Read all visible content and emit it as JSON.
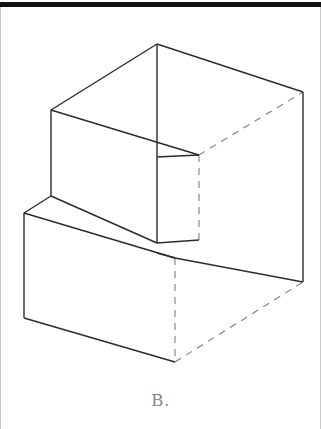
{
  "figure": {
    "caption": "B.",
    "type": "isometric-line-drawing",
    "stroke_color": "#2b2b2b",
    "hidden_stroke_color": "#7d7d7d",
    "background_color": "#ffffff",
    "rule_color": "#111111",
    "border_color": "#c9c9c9",
    "caption_color": "#8a8a8a",
    "solid_edges": [
      {
        "name": "top-left-edge",
        "x1": 157,
        "y1": 44,
        "x2": 51,
        "y2": 110
      },
      {
        "name": "top-right-edge",
        "x1": 157,
        "y1": 44,
        "x2": 303,
        "y2": 92
      },
      {
        "name": "center-vertical-front-edge",
        "x1": 157,
        "y1": 44,
        "x2": 157,
        "y2": 243
      },
      {
        "name": "upper-left-vertical-edge",
        "x1": 51,
        "y1": 110,
        "x2": 51,
        "y2": 196
      },
      {
        "name": "upper-front-face-diagonal",
        "x1": 51,
        "y1": 110,
        "x2": 199,
        "y2": 155
      },
      {
        "name": "upper-step-top-edge",
        "x1": 157,
        "y1": 157,
        "x2": 199,
        "y2": 155
      },
      {
        "name": "step-lower-left-diagonal",
        "x1": 51,
        "y1": 196,
        "x2": 157,
        "y2": 243
      },
      {
        "name": "step-top-right-edge",
        "x1": 157,
        "y1": 243,
        "x2": 199,
        "y2": 240
      },
      {
        "name": "lower-left-short-vertical",
        "x1": 24,
        "y1": 213,
        "x2": 24,
        "y2": 318
      },
      {
        "name": "lower-left-top-diagonal",
        "x1": 24,
        "y1": 213,
        "x2": 51,
        "y2": 196
      },
      {
        "name": "lower-front-top-diagonal",
        "x1": 24,
        "y1": 213,
        "x2": 175,
        "y2": 258
      },
      {
        "name": "lower-step-face-edge",
        "x1": 157,
        "y1": 253,
        "x2": 175,
        "y2": 258
      },
      {
        "name": "lower-front-bottom-diagonal",
        "x1": 24,
        "y1": 318,
        "x2": 175,
        "y2": 362
      },
      {
        "name": "lower-right-top-diagonal",
        "x1": 175,
        "y1": 258,
        "x2": 303,
        "y2": 282
      },
      {
        "name": "right-rear-vertical-solid",
        "x1": 303,
        "y1": 92,
        "x2": 303,
        "y2": 282
      }
    ],
    "dashed_edges": [
      {
        "name": "hidden-upper-rear-diagonal",
        "x1": 199,
        "y1": 155,
        "x2": 303,
        "y2": 92
      },
      {
        "name": "hidden-upper-vertical",
        "x1": 199,
        "y1": 155,
        "x2": 199,
        "y2": 240
      },
      {
        "name": "hidden-step-vertical",
        "x1": 175,
        "y1": 258,
        "x2": 175,
        "y2": 362
      },
      {
        "name": "hidden-bottom-diagonal",
        "x1": 175,
        "y1": 362,
        "x2": 303,
        "y2": 282
      }
    ]
  }
}
